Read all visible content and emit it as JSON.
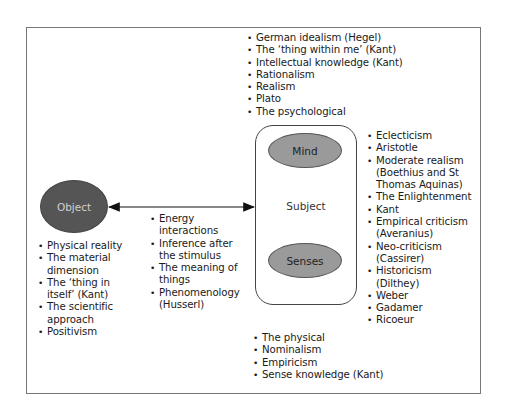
{
  "diagram": {
    "object": {
      "label": "Object",
      "fill": "#555555",
      "text_color": "#d0d0d0"
    },
    "subject": {
      "label": "Subject",
      "mind": {
        "label": "Mind",
        "fill": "#9a9a9a"
      },
      "senses": {
        "label": "Senses",
        "fill": "#9a9a9a"
      }
    },
    "arrow": {
      "type": "bidirectional",
      "from": "Object",
      "to": "Subject"
    },
    "lists": {
      "mind_top": [
        "German idealism (Hegel)",
        "The ‘thing within me’ (Kant)",
        "Intellectual knowledge (Kant)",
        "Rationalism",
        "Realism",
        "Plato",
        "The psychological"
      ],
      "subject_right": [
        "Eclecticism",
        "Aristotle",
        "Moderate realism\n(Boethius and St\nThomas Aquinas)",
        "The Enlightenment",
        "Kant",
        "Empirical criticism\n(Averanius)",
        "Neo-criticism\n(Cassirer)",
        "Historicism\n(Dilthey)",
        "Weber",
        "Gadamer",
        "Ricoeur"
      ],
      "object_left": [
        "Physical reality",
        "The material\ndimension",
        "The ‘thing in\nitself’ (Kant)",
        "The scientific\napproach",
        "Positivism"
      ],
      "interaction_middle": [
        "Energy\ninteractions",
        "Inference after\nthe stimulus",
        "The meaning of\nthings",
        "Phenomenology\n(Husserl)"
      ],
      "senses_bottom": [
        "The physical",
        "Nominalism",
        "Empiricism",
        "Sense knowledge (Kant)"
      ]
    }
  }
}
